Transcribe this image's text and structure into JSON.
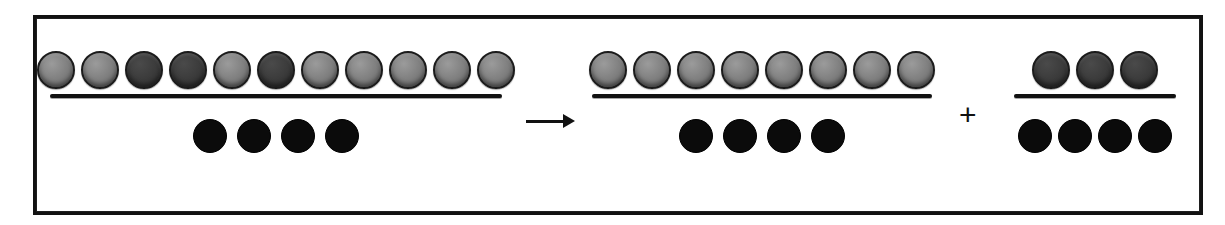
{
  "figure": {
    "type": "fraction-equivalence-diagram",
    "frame": {
      "visible": true,
      "color": "#121212"
    },
    "background_color": "#ffffff",
    "chip_colors": {
      "numerator_chip": "#6f6f6f",
      "numerator_chip_dark": "#3a3a3a",
      "denominator_chip": "#0b0b0b",
      "outline": "#1b1b1b"
    },
    "operators": {
      "arrow": "→",
      "arrow_name": "right-arrow",
      "plus": "+"
    },
    "terms": [
      {
        "id": "term-1",
        "role": "left-hand-side",
        "numerator_count": 11,
        "denominator_count": 4,
        "numerator_chip_shades": [
          "light",
          "light",
          "dark",
          "dark",
          "light",
          "dark",
          "light",
          "light",
          "light",
          "light",
          "light"
        ],
        "fraction_text": "11/4"
      },
      {
        "id": "term-2",
        "role": "right-hand-side-first",
        "numerator_count": 8,
        "denominator_count": 4,
        "numerator_chip_shades": [
          "light",
          "light",
          "light",
          "light",
          "light",
          "light",
          "light",
          "light"
        ],
        "fraction_text": "8/4"
      },
      {
        "id": "term-3",
        "role": "right-hand-side-second",
        "numerator_count": 3,
        "denominator_count": 4,
        "numerator_chip_shades": [
          "dark",
          "dark",
          "dark"
        ],
        "fraction_text": "3/4"
      }
    ],
    "equation_text": "11/4 → 8/4 + 3/4"
  }
}
